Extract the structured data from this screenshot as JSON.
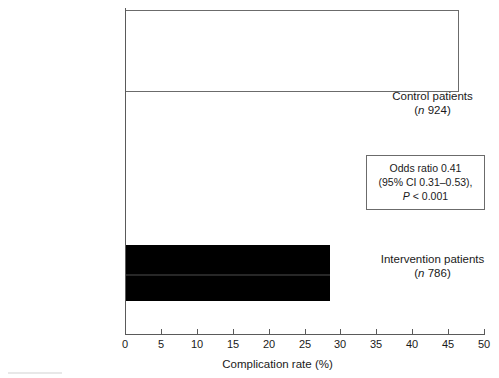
{
  "chart_data": {
    "type": "bar",
    "orientation": "horizontal",
    "title": "",
    "xlabel": "Complication rate (%)",
    "ylabel": "",
    "xlim": [
      0,
      50
    ],
    "xticks": [
      0,
      5,
      10,
      15,
      20,
      25,
      30,
      35,
      40,
      45,
      50
    ],
    "grid": false,
    "legend": null,
    "categories": [
      "Control patients",
      "Intervention patients"
    ],
    "values": [
      46.5,
      28.5
    ],
    "bars": [
      {
        "category": "Control patients",
        "label_line1": "Control patients",
        "label_line2_prefix": "(",
        "label_line2_italic": "n",
        "label_line2_suffix": " 924)",
        "n": 924,
        "value": 46.5,
        "style": "open",
        "fill": "#ffffff",
        "stroke": "#6b6b6b"
      },
      {
        "category": "Intervention patients",
        "label_line1": "Intervention patients",
        "label_line2_prefix": "(",
        "label_line2_italic": "n",
        "label_line2_suffix": " 786)",
        "n": 786,
        "value": 28.5,
        "style": "filled",
        "fill": "#000000",
        "stroke": "#000000"
      }
    ],
    "annotations": [
      {
        "line1": "Odds ratio 0.41",
        "line2": "(95% CI 0.31–0.53),",
        "line3_italic": "P",
        "line3_rest": " < 0.001"
      }
    ]
  },
  "axis": {
    "tick_labels": [
      "0",
      "5",
      "10",
      "15",
      "20",
      "25",
      "30",
      "35",
      "40",
      "45",
      "50"
    ],
    "title": "Complication rate (%)"
  },
  "labels": {
    "control_line1": "Control patients",
    "control_n_italic": "n",
    "control_n_value": " 924)",
    "control_paren_open": "(",
    "intervention_line1": "Intervention patients",
    "intervention_n_italic": "n",
    "intervention_n_value": " 786)",
    "intervention_paren_open": "("
  },
  "annotation": {
    "odds_ratio": "Odds ratio 0.41",
    "confidence_interval": "(95% CI 0.31–0.53),",
    "p_italic": "P",
    "p_value": " < 0.001"
  },
  "colors": {
    "bar_filled": "#000000",
    "bar_open_fill": "#ffffff",
    "bar_stroke": "#6b6b6b",
    "axis": "#5a5a5a",
    "text": "#1a1a1a",
    "background": "#ffffff"
  }
}
